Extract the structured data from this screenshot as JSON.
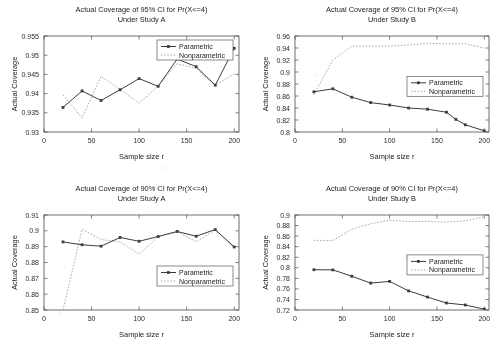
{
  "figure": {
    "background": "#ffffff",
    "line_color_parametric": "#3c3c3c",
    "line_color_nonparametric": "#a9a9a9",
    "legend": {
      "parametric_label": "Parametric",
      "nonparametric_label": "Nonparametric"
    }
  },
  "chart_data": [
    {
      "type": "line",
      "id": "top-left",
      "title": "Actual Coverage of 95% CI for Pr(X<=4)",
      "subtitle": "Under Study A",
      "xlabel": "Sample size r",
      "ylabel": "Actual Coverage",
      "xlim": [
        0,
        205
      ],
      "ylim": [
        0.93,
        0.955
      ],
      "xticks": [
        0,
        50,
        100,
        150,
        200
      ],
      "yticks": [
        0.93,
        0.935,
        0.94,
        0.945,
        0.95,
        0.955
      ],
      "ytick_labels": [
        "0.93",
        "0.935",
        "0.94",
        "0.945",
        "0.95",
        "0.955"
      ],
      "grid": false,
      "legend_position": "top-right",
      "x": [
        20,
        40,
        60,
        80,
        100,
        120,
        140,
        160,
        180,
        200
      ],
      "series": [
        {
          "name": "Parametric",
          "markers": true,
          "values": [
            0.9364,
            0.9407,
            0.9382,
            0.941,
            0.9439,
            0.9419,
            0.949,
            0.947,
            0.9422,
            0.9518
          ]
        },
        {
          "name": "Nonparametric",
          "markers": false,
          "values": [
            0.9397,
            0.9337,
            0.9445,
            0.9411,
            0.9375,
            0.942,
            0.9478,
            0.9465,
            0.9421,
            0.9452
          ]
        }
      ]
    },
    {
      "type": "line",
      "id": "top-right",
      "title": "Actual Coverage of 95% CI for Pr(X<=4)",
      "subtitle": "Under Study B",
      "xlabel": "Sample size r",
      "ylabel": "Actual Coverage",
      "xlim": [
        0,
        205
      ],
      "ylim": [
        0.8,
        0.96
      ],
      "xticks": [
        0,
        50,
        100,
        150,
        200
      ],
      "yticks": [
        0.8,
        0.82,
        0.84,
        0.86,
        0.88,
        0.9,
        0.92,
        0.94,
        0.96
      ],
      "ytick_labels": [
        "0.8",
        "0.82",
        "0.84",
        "0.86",
        "0.88",
        "0.9",
        "0.92",
        "0.94",
        "0.96"
      ],
      "grid": false,
      "legend_position": "middle-right",
      "x": [
        20,
        40,
        60,
        80,
        100,
        120,
        140,
        160,
        170,
        180,
        200
      ],
      "series": [
        {
          "name": "Parametric",
          "markers": true,
          "values": [
            0.867,
            0.872,
            0.858,
            0.849,
            0.845,
            0.84,
            0.838,
            0.833,
            0.821,
            0.812,
            0.802
          ]
        },
        {
          "name": "Nonparametric",
          "markers": false,
          "values": [
            0.862,
            0.92,
            0.943,
            0.943,
            0.943,
            0.945,
            0.948,
            0.947,
            0.947,
            0.947,
            0.94
          ]
        }
      ]
    },
    {
      "type": "line",
      "id": "bottom-left",
      "title": "Actual Coverage of 90% CI for Pr(X<=4)",
      "subtitle": "Under Study A",
      "xlabel": "Sample size r",
      "ylabel": "Actual Coverage",
      "xlim": [
        0,
        205
      ],
      "ylim": [
        0.85,
        0.91
      ],
      "xticks": [
        0,
        50,
        100,
        150,
        200
      ],
      "yticks": [
        0.85,
        0.86,
        0.87,
        0.88,
        0.89,
        0.9,
        0.91
      ],
      "ytick_labels": [
        "0.85",
        "0.86",
        "0.87",
        "0.88",
        "0.89",
        "0.9",
        "0.91"
      ],
      "grid": false,
      "legend_position": "bottom-right",
      "x": [
        20,
        40,
        60,
        80,
        100,
        120,
        140,
        160,
        180,
        200
      ],
      "series": [
        {
          "name": "Parametric",
          "markers": true,
          "values": [
            0.893,
            0.8912,
            0.8903,
            0.8958,
            0.8934,
            0.8964,
            0.8996,
            0.8966,
            0.9008,
            0.8898
          ]
        },
        {
          "name": "Nonparametric",
          "markers": false,
          "values": [
            0.85,
            0.901,
            0.8945,
            0.893,
            0.8853,
            0.8962,
            0.8994,
            0.8932,
            0.9005,
            0.889
          ]
        }
      ]
    },
    {
      "type": "line",
      "id": "bottom-right",
      "title": "Actual Coverage of 90% CI for Pr(X<=4)",
      "subtitle": "Under Study B",
      "xlabel": "Sample size r",
      "ylabel": "Actual Coverage",
      "xlim": [
        0,
        205
      ],
      "ylim": [
        0.72,
        0.9
      ],
      "xticks": [
        0,
        50,
        100,
        150,
        200
      ],
      "yticks": [
        0.72,
        0.74,
        0.76,
        0.78,
        0.8,
        0.82,
        0.84,
        0.86,
        0.88,
        0.9
      ],
      "ytick_labels": [
        "0.72",
        "0.74",
        "0.76",
        "0.78",
        "0.8",
        "0.82",
        "0.84",
        "0.86",
        "0.88",
        "0.9"
      ],
      "grid": false,
      "legend_position": "middle-right",
      "x": [
        20,
        40,
        60,
        80,
        100,
        120,
        140,
        160,
        180,
        200
      ],
      "series": [
        {
          "name": "Parametric",
          "markers": true,
          "values": [
            0.7963,
            0.796,
            0.784,
            0.771,
            0.7742,
            0.7562,
            0.7445,
            0.7333,
            0.7295,
            0.7215
          ]
        },
        {
          "name": "Nonparametric",
          "markers": false,
          "values": [
            0.852,
            0.8515,
            0.873,
            0.8835,
            0.89,
            0.8875,
            0.888,
            0.8865,
            0.889,
            0.8965
          ]
        }
      ]
    }
  ]
}
